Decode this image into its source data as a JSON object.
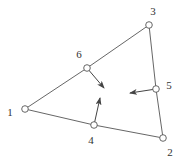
{
  "diagram": {
    "type": "triangular-element",
    "nodes": [
      {
        "id": "1",
        "label": "1",
        "x": 25,
        "y": 109,
        "label_x": 10,
        "label_y": 112
      },
      {
        "id": "2",
        "label": "2",
        "x": 163,
        "y": 138,
        "label_x": 170,
        "label_y": 152
      },
      {
        "id": "3",
        "label": "3",
        "x": 149,
        "y": 25,
        "label_x": 153,
        "label_y": 11
      },
      {
        "id": "4",
        "label": "4",
        "x": 94,
        "y": 125,
        "label_x": 91,
        "label_y": 140
      },
      {
        "id": "5",
        "label": "5",
        "x": 156,
        "y": 89,
        "label_x": 169,
        "label_y": 85
      },
      {
        "id": "6",
        "label": "6",
        "x": 87,
        "y": 68,
        "label_x": 79,
        "label_y": 54
      }
    ],
    "edges": [
      {
        "from": "1",
        "to": "4"
      },
      {
        "from": "4",
        "to": "2"
      },
      {
        "from": "2",
        "to": "5"
      },
      {
        "from": "5",
        "to": "3"
      },
      {
        "from": "3",
        "to": "6"
      },
      {
        "from": "6",
        "to": "1"
      }
    ],
    "arrows": [
      {
        "from_node": "6",
        "x1": 87,
        "y1": 68,
        "x2": 104,
        "y2": 88
      },
      {
        "from_node": "4",
        "x1": 94,
        "y1": 125,
        "x2": 100,
        "y2": 98
      },
      {
        "from_node": "5",
        "x1": 156,
        "y1": 89,
        "x2": 130,
        "y2": 93
      }
    ],
    "colors": {
      "line": "#555555",
      "node_fill": "#ffffff",
      "node_stroke": "#555555",
      "label": "#333333"
    }
  }
}
